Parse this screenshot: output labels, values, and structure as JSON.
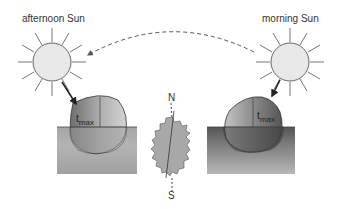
{
  "labels": {
    "afternoon_sun": "afternoon Sun",
    "morning_sun": "morning Sun",
    "tmax_symbol": "t",
    "tmax_subscript": "max",
    "north": "N",
    "south": "S"
  },
  "colors": {
    "sun_fill": "#e6e6e6",
    "outline": "#555555",
    "ground_top": "#8a8a8a",
    "ground_bottom": "#c8c8c8",
    "rock_shape": "#a8a8a8"
  }
}
